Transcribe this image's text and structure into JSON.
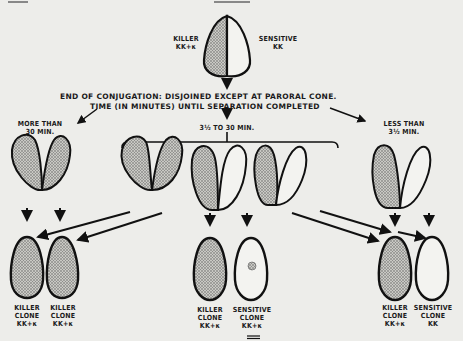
{
  "page_header": {
    "page_number": "360",
    "running_title": "SONNEBORN"
  },
  "diagram": {
    "top_pair": {
      "left_label": "KILLER\nKK+κ",
      "right_label": "SENSITIVE\nKK"
    },
    "stage_caption": {
      "line1": "END OF CONJUGATION: DISJOINED EXCEPT AT PARORAL CONE.",
      "line2": "TIME (IN MINUTES) UNTIL SEPARATION COMPLETED"
    },
    "branches": [
      {
        "id": "more-than-30",
        "label": "MORE THAN\n30 MIN."
      },
      {
        "id": "3.5-to-30",
        "label": "3½ TO 30 MIN."
      },
      {
        "id": "less-than-3.5",
        "label": "LESS THAN\n3½ MIN."
      }
    ],
    "clones": [
      {
        "label": "KILLER\nCLONE\nKK+κ"
      },
      {
        "label": "KILLER\nCLONE\nKK+κ"
      },
      {
        "label": "KILLER\nCLONE\nKK+κ"
      },
      {
        "label": "SENSITIVE\nCLONE\nKK+κ"
      },
      {
        "label": "KILLER\nCLONE\nKK+κ"
      },
      {
        "label": "SENSITIVE\nCLONE\nKK"
      }
    ],
    "colors": {
      "ink": "#111111",
      "paper": "#ededea",
      "stipple": "#9a9a96"
    }
  }
}
